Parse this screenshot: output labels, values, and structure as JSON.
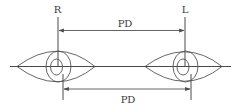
{
  "diagram": {
    "labels": {
      "right_eye": "R",
      "left_eye": "L",
      "top_dimension": "PD",
      "bottom_dimension": "PD"
    },
    "colors": {
      "line": "#4a4a4a",
      "text": "#3a3a3a",
      "background": "#ffffff"
    },
    "elements": [
      {
        "id": "right-eye",
        "label": "R",
        "shape": "almond eye outline with iris and pupil"
      },
      {
        "id": "left-eye",
        "label": "L",
        "shape": "almond eye outline with iris and pupil"
      },
      {
        "id": "top-pd-dimension",
        "label": "PD",
        "shape": "double-headed arrow between vertical center lines"
      },
      {
        "id": "bottom-pd-dimension",
        "label": "PD",
        "shape": "double-headed arrow between offset vertical lines"
      },
      {
        "id": "horizontal-axis",
        "shape": "horizontal line through both eyes"
      }
    ]
  }
}
